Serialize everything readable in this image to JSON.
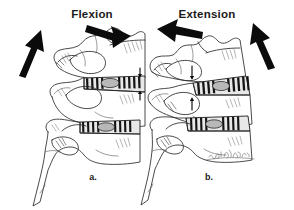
{
  "figure": {
    "background_color": "#ffffff",
    "ink_color": "#1c1c1c",
    "panels": [
      {
        "id": "a",
        "title": "Flexion",
        "letter": "a.",
        "arrows": [
          {
            "name": "superior-anterior-glide-arrow",
            "direction": "up-right",
            "style": "thick-solid-black"
          },
          {
            "name": "anterior-tilt-arrow",
            "direction": "down-right",
            "style": "thick-solid-black"
          }
        ],
        "measurement": {
          "name": "disc-height-anterior-open",
          "description": "paired arrows diverging at anterior disc space",
          "arrow_count": 2
        },
        "discs": [
          {
            "name": "upper-intervertebral-disc",
            "stripes": 9
          },
          {
            "name": "lower-intervertebral-disc",
            "stripes": 8
          }
        ]
      },
      {
        "id": "b",
        "title": "Extension",
        "letter": "b.",
        "arrows": [
          {
            "name": "posterior-tilt-arrow",
            "direction": "down-left",
            "style": "thick-solid-black"
          },
          {
            "name": "superior-posterior-glide-arrow",
            "direction": "up-right",
            "style": "thick-solid-black"
          }
        ],
        "measurement": {
          "name": "disc-height-anterior-narrowed",
          "description": "paired arrows converging at anterior disc space",
          "arrow_count": 2
        },
        "discs": [
          {
            "name": "upper-intervertebral-disc",
            "stripes": 9
          },
          {
            "name": "lower-intervertebral-disc",
            "stripes": 8
          }
        ]
      }
    ],
    "signature": {
      "name": "artist-signature",
      "text": "",
      "style": "cursive-script-illegible"
    }
  }
}
